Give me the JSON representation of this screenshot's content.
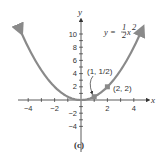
{
  "chart_data": {
    "type": "line",
    "title": "",
    "caption": "(c)",
    "xlabel": "x",
    "ylabel": "y",
    "xlim": [
      -4.5,
      4.8
    ],
    "ylim": [
      -5,
      12
    ],
    "x_ticks": [
      -4,
      -2,
      2,
      4
    ],
    "x_tick_labels": [
      "−4",
      "−2",
      "2",
      "4"
    ],
    "y_ticks": [
      -4,
      -2,
      2,
      4,
      6,
      8,
      10
    ],
    "y_tick_labels": [
      "−4",
      "−2",
      "2",
      "4",
      "6",
      "8",
      "10"
    ],
    "grid": false,
    "series": [
      {
        "name": "y = 1/2 x^2",
        "equation_label": {
          "lhs": "y =",
          "num": "1",
          "den": "2",
          "var": "x",
          "exp": "2"
        },
        "color": "#8a8a8a",
        "x": [
          -4.6,
          -4,
          -3,
          -2,
          -1,
          0,
          1,
          2,
          3,
          4,
          4.6
        ],
        "values": [
          10.58,
          8,
          4.5,
          2,
          0.5,
          0,
          0.5,
          2,
          4.5,
          8,
          10.58
        ],
        "arrows_at_ends": true
      }
    ],
    "points": [
      {
        "x": 1,
        "y": 0.5,
        "label": "(1, 1/2)"
      },
      {
        "x": 2,
        "y": 2,
        "label": "(2, 2)"
      }
    ],
    "annotations": [
      {
        "text": "(1, 1/2)",
        "arrow_to": [
          1,
          0.5
        ]
      },
      {
        "text": "(2, 2)"
      }
    ]
  }
}
